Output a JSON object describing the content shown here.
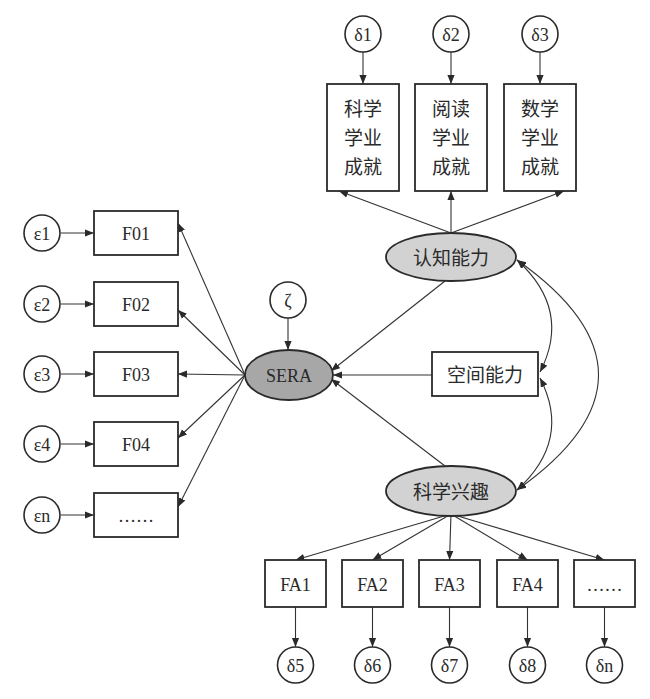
{
  "diagram": {
    "type": "structural-equation-model",
    "outcome": {
      "id": "sera",
      "label": "SERA",
      "disturbance": "ζ"
    },
    "sera_indicators": [
      {
        "id": "f01",
        "label": "F01",
        "error": "ε1"
      },
      {
        "id": "f02",
        "label": "F02",
        "error": "ε2"
      },
      {
        "id": "f03",
        "label": "F03",
        "error": "ε3"
      },
      {
        "id": "f04",
        "label": "F04",
        "error": "ε4"
      },
      {
        "id": "fn",
        "label": "……",
        "error": "εn"
      }
    ],
    "predictors": {
      "cognitive": {
        "id": "cognitive",
        "label": "认知能力",
        "indicators": [
          {
            "id": "sci",
            "lines": [
              "科学",
              "学业",
              "成就"
            ],
            "error": "δ1"
          },
          {
            "id": "read",
            "lines": [
              "阅读",
              "学业",
              "成就"
            ],
            "error": "δ2"
          },
          {
            "id": "math",
            "lines": [
              "数学",
              "学业",
              "成就"
            ],
            "error": "δ3"
          }
        ]
      },
      "spatial": {
        "id": "spatial",
        "label": "空间能力"
      },
      "interest": {
        "id": "interest",
        "label": "科学兴趣",
        "indicators": [
          {
            "id": "fa1",
            "label": "FA1",
            "error": "δ5"
          },
          {
            "id": "fa2",
            "label": "FA2",
            "error": "δ6"
          },
          {
            "id": "fa3",
            "label": "FA3",
            "error": "δ7"
          },
          {
            "id": "fa4",
            "label": "FA4",
            "error": "δ8"
          },
          {
            "id": "fan",
            "label": "……",
            "error": "δn"
          }
        ]
      }
    },
    "paths": [
      {
        "from": "认知能力",
        "to": "SERA",
        "kind": "directed"
      },
      {
        "from": "空间能力",
        "to": "SERA",
        "kind": "directed"
      },
      {
        "from": "科学兴趣",
        "to": "SERA",
        "kind": "directed"
      },
      {
        "from": "ζ",
        "to": "SERA",
        "kind": "directed"
      },
      {
        "from": "认知能力",
        "to": "空间能力",
        "kind": "covariance"
      },
      {
        "from": "空间能力",
        "to": "科学兴趣",
        "kind": "covariance"
      },
      {
        "from": "认知能力",
        "to": "科学兴趣",
        "kind": "covariance"
      }
    ],
    "colors": {
      "outcome_fill": "#a7a7a7",
      "latent_fill": "#d2d2d2",
      "stroke": "#2a2a2a"
    }
  }
}
